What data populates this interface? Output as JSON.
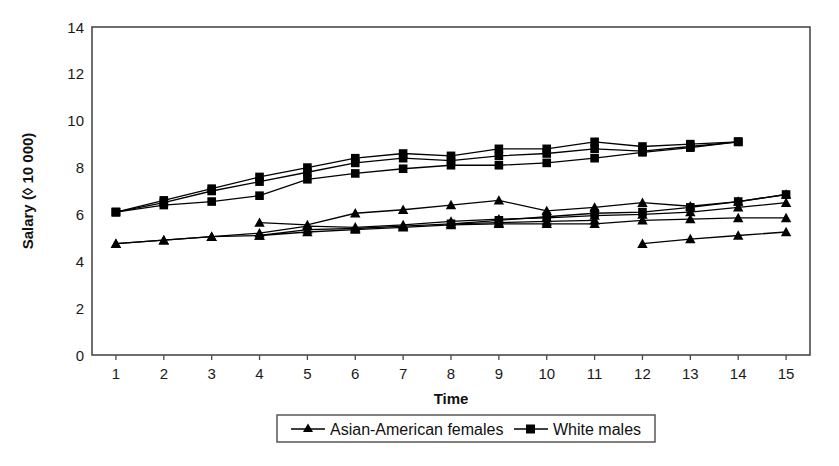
{
  "chart_data": {
    "type": "line",
    "title": "",
    "subtitle": "",
    "xlabel": "Time",
    "ylabel": "Salary (◊ 10 000)",
    "xlim": [
      0.5,
      15.5
    ],
    "ylim": [
      0,
      14
    ],
    "ytick_step": 2,
    "grid": false,
    "legend_position": "bottom",
    "xticks": [
      1,
      2,
      3,
      4,
      5,
      6,
      7,
      8,
      9,
      10,
      11,
      12,
      13,
      14,
      15
    ],
    "yticks": [
      0,
      2,
      4,
      6,
      8,
      10,
      12,
      14
    ],
    "xtick_labels": [
      "1",
      "2",
      "3",
      "4",
      "5",
      "6",
      "7",
      "8",
      "9",
      "10",
      "11",
      "12",
      "13",
      "14",
      "15"
    ],
    "ytick_labels": [
      "0",
      "2",
      "4",
      "6",
      "8",
      "10",
      "12",
      "14"
    ],
    "legend": [
      {
        "label": "Asian-American females",
        "marker": "triangle"
      },
      {
        "label": "White males",
        "marker": "square"
      }
    ],
    "series": [
      {
        "name": "White males A",
        "group": "White males",
        "marker": "square",
        "x": [
          1,
          2,
          3,
          4,
          5,
          6,
          7,
          8,
          9,
          10,
          11,
          12,
          13,
          14
        ],
        "values": [
          6.1,
          6.6,
          7.1,
          7.6,
          8.0,
          8.4,
          8.6,
          8.5,
          8.8,
          8.8,
          9.1,
          8.9,
          9.0,
          9.1
        ]
      },
      {
        "name": "White males B",
        "group": "White males",
        "marker": "square",
        "x": [
          1,
          2,
          3,
          4,
          5,
          6,
          7,
          8,
          9,
          10,
          11,
          12,
          13,
          14
        ],
        "values": [
          6.1,
          6.5,
          7.0,
          7.4,
          7.8,
          8.2,
          8.4,
          8.3,
          8.5,
          8.6,
          8.8,
          8.7,
          8.9,
          9.1
        ]
      },
      {
        "name": "White males C",
        "group": "White males",
        "marker": "square",
        "x": [
          1,
          2,
          3,
          4,
          5,
          6,
          7,
          8,
          9,
          10,
          11,
          12,
          13,
          14
        ],
        "values": [
          6.1,
          6.4,
          6.55,
          6.8,
          7.5,
          7.75,
          7.95,
          8.1,
          8.1,
          8.2,
          8.4,
          8.65,
          8.85,
          9.1
        ]
      },
      {
        "name": "White males D",
        "group": "White males",
        "marker": "square",
        "x": [
          8,
          9,
          10,
          11,
          12,
          13,
          14,
          15
        ],
        "values": [
          5.6,
          5.75,
          5.9,
          6.05,
          6.1,
          6.3,
          6.55,
          6.85
        ]
      },
      {
        "name": "Asian-American females A",
        "group": "Asian-American females",
        "marker": "triangle",
        "x": [
          4,
          5,
          6,
          7,
          8,
          9,
          10,
          11,
          12,
          13,
          14,
          15
        ],
        "values": [
          5.65,
          5.55,
          6.05,
          6.2,
          6.4,
          6.6,
          6.15,
          6.3,
          6.5,
          6.35,
          6.55,
          6.85
        ]
      },
      {
        "name": "Asian-American females B",
        "group": "Asian-American females",
        "marker": "triangle",
        "x": [
          1,
          2,
          3,
          4,
          5,
          6,
          7,
          8,
          9,
          10,
          11,
          12,
          13,
          14,
          15
        ],
        "values": [
          4.75,
          4.9,
          5.05,
          5.2,
          5.5,
          5.45,
          5.55,
          5.7,
          5.8,
          5.85,
          5.95,
          6.0,
          6.1,
          6.3,
          6.5
        ]
      },
      {
        "name": "Asian-American females C",
        "group": "Asian-American females",
        "marker": "triangle",
        "x": [
          1,
          2,
          3,
          4,
          5,
          6,
          7,
          8,
          9,
          10,
          11,
          12,
          13,
          14,
          15
        ],
        "values": [
          4.75,
          4.9,
          5.05,
          5.1,
          5.25,
          5.35,
          5.45,
          5.55,
          5.6,
          5.6,
          5.6,
          5.75,
          5.8,
          5.85,
          5.85
        ]
      },
      {
        "name": "Asian-American females D",
        "group": "Asian-American females",
        "marker": "triangle",
        "x": [
          4,
          5,
          6,
          7,
          8,
          9,
          10,
          11
        ],
        "values": [
          5.1,
          5.35,
          5.4,
          5.5,
          5.6,
          5.65,
          5.7,
          5.75
        ]
      },
      {
        "name": "Asian-American females E",
        "group": "Asian-American females",
        "marker": "triangle",
        "x": [
          12,
          13,
          14,
          15
        ],
        "values": [
          4.75,
          4.95,
          5.1,
          5.25
        ]
      }
    ]
  },
  "colors": {
    "ink": "#000000",
    "frame": "#4a4a4a",
    "background": "#ffffff"
  }
}
